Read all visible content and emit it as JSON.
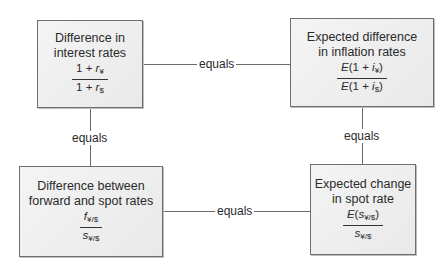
{
  "boxes": {
    "interest": {
      "title_line1": "Difference in",
      "title_line2": "interest rates",
      "numerator": "1 + ",
      "numerator_var": "r",
      "numerator_sub": "¥",
      "denominator": "1 + ",
      "denominator_var": "r",
      "denominator_sub": "$"
    },
    "inflation": {
      "title_line1": "Expected difference",
      "title_line2": "in inflation rates",
      "numerator_pre": "E",
      "numerator_mid": "(1 + ",
      "numerator_var": "i",
      "numerator_sub": "¥",
      "numerator_post": ")",
      "denominator_pre": "E",
      "denominator_mid": "(1 + ",
      "denominator_var": "i",
      "denominator_sub": "$",
      "denominator_post": ")"
    },
    "forward_spot": {
      "title_line1": "Difference between",
      "title_line2": "forward and spot rates",
      "numerator_var": "f",
      "numerator_sub": "¥/$",
      "denominator_var": "s",
      "denominator_sub": "¥/$"
    },
    "spot_change": {
      "title_line1": "Expected change",
      "title_line2": "in spot rate",
      "numerator_pre": "E",
      "numerator_open": "(",
      "numerator_var": "s",
      "numerator_sub": "¥/$",
      "numerator_close": ")",
      "denominator_var": "s",
      "denominator_sub": "¥/$"
    }
  },
  "connectors": {
    "top": "equals",
    "left": "equals",
    "right": "equals",
    "bottom": "equals"
  }
}
